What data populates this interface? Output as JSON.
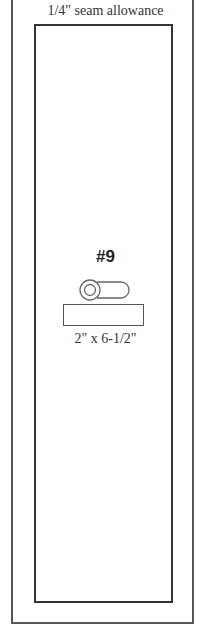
{
  "seam": {
    "label": "1/4\" seam allowance"
  },
  "piece": {
    "number": "#9",
    "dimensions": "2\" x 6-1/2\"",
    "icon": "grain-direction-icon"
  },
  "colors": {
    "outer_border": "#555555",
    "inner_border": "#333333",
    "text": "#333333"
  }
}
